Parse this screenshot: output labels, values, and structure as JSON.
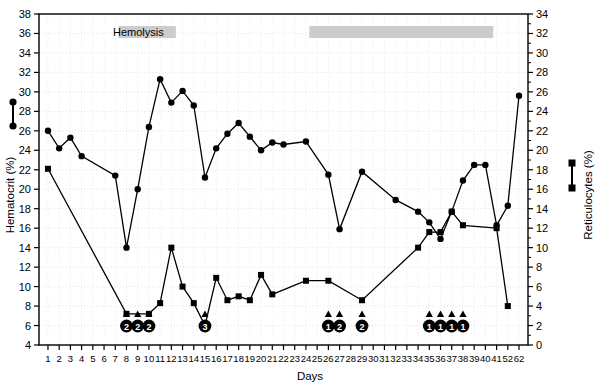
{
  "chart_data": {
    "type": "line",
    "title": "",
    "xlabel": "Days",
    "ylabel": "Hematocrit (%)",
    "y2label": "Reticulocytes (%)",
    "grid": true,
    "legend_position": "outside-left-and-right",
    "ylim": [
      4,
      38
    ],
    "ytick_step": 2,
    "yticks": [
      4,
      6,
      8,
      10,
      12,
      14,
      16,
      18,
      20,
      22,
      24,
      26,
      28,
      30,
      32,
      34,
      36,
      38
    ],
    "y2lim": [
      0,
      34
    ],
    "y2tick_step": 2,
    "y2ticks": [
      0,
      2,
      4,
      6,
      8,
      10,
      12,
      14,
      16,
      18,
      20,
      22,
      24,
      26,
      28,
      30,
      32,
      34
    ],
    "x": [
      1,
      2,
      3,
      4,
      5,
      6,
      7,
      8,
      9,
      10,
      11,
      12,
      13,
      14,
      15,
      16,
      17,
      18,
      19,
      20,
      21,
      22,
      23,
      24,
      25,
      26,
      27,
      28,
      29,
      30,
      31,
      32,
      33,
      34,
      35,
      36,
      37,
      38,
      39,
      40,
      41,
      52,
      62
    ],
    "xtick_labels": [
      "1",
      "2",
      "3",
      "4",
      "5",
      "6",
      "7",
      "8",
      "9",
      "10",
      "11",
      "12",
      "13",
      "14",
      "15",
      "16",
      "17",
      "18",
      "19",
      "20",
      "21",
      "22",
      "23",
      "24",
      "25",
      "26",
      "27",
      "28",
      "29",
      "30",
      "31",
      "32",
      "33",
      "34",
      "35",
      "36",
      "37",
      "38",
      "39",
      "40",
      "41",
      "52",
      "62"
    ],
    "series": [
      {
        "name": "Hematocrit (%)",
        "axis": "left",
        "marker": "circle",
        "color": "#000000",
        "points": [
          {
            "x": 1,
            "y": 26.0
          },
          {
            "x": 2,
            "y": 24.2
          },
          {
            "x": 3,
            "y": 25.3
          },
          {
            "x": 4,
            "y": 23.4
          },
          {
            "x": 7,
            "y": 21.4
          },
          {
            "x": 8,
            "y": 14.0
          },
          {
            "x": 9,
            "y": 20.0
          },
          {
            "x": 10,
            "y": 26.4
          },
          {
            "x": 11,
            "y": 31.3
          },
          {
            "x": 12,
            "y": 28.9
          },
          {
            "x": 13,
            "y": 30.1
          },
          {
            "x": 14,
            "y": 28.6
          },
          {
            "x": 15,
            "y": 21.2
          },
          {
            "x": 16,
            "y": 24.2
          },
          {
            "x": 17,
            "y": 25.7
          },
          {
            "x": 18,
            "y": 26.8
          },
          {
            "x": 19,
            "y": 25.4
          },
          {
            "x": 20,
            "y": 24.0
          },
          {
            "x": 21,
            "y": 24.8
          },
          {
            "x": 22,
            "y": 24.6
          },
          {
            "x": 24,
            "y": 24.9
          },
          {
            "x": 26,
            "y": 21.5
          },
          {
            "x": 27,
            "y": 15.9
          },
          {
            "x": 29,
            "y": 21.8
          },
          {
            "x": 32,
            "y": 18.9
          },
          {
            "x": 34,
            "y": 17.7
          },
          {
            "x": 35,
            "y": 16.6
          },
          {
            "x": 36,
            "y": 14.9
          },
          {
            "x": 37,
            "y": 17.7
          },
          {
            "x": 38,
            "y": 20.9
          },
          {
            "x": 39,
            "y": 22.5
          },
          {
            "x": 40,
            "y": 22.5
          },
          {
            "x": 41,
            "y": 16.3
          },
          {
            "x": 52,
            "y": 18.3
          },
          {
            "x": 62,
            "y": 29.6
          }
        ]
      },
      {
        "name": "Reticulocytes (%)",
        "axis": "right",
        "marker": "square",
        "color": "#000000",
        "points": [
          {
            "x": 1,
            "y": 18.1
          },
          {
            "x": 8,
            "y": 3.2
          },
          {
            "x": 10,
            "y": 3.2
          },
          {
            "x": 11,
            "y": 4.3
          },
          {
            "x": 12,
            "y": 10.0
          },
          {
            "x": 13,
            "y": 6.0
          },
          {
            "x": 14,
            "y": 4.3
          },
          {
            "x": 15,
            "y": 2.0
          },
          {
            "x": 16,
            "y": 6.9
          },
          {
            "x": 17,
            "y": 4.6
          },
          {
            "x": 18,
            "y": 5.0
          },
          {
            "x": 19,
            "y": 4.6
          },
          {
            "x": 20,
            "y": 7.2
          },
          {
            "x": 21,
            "y": 5.2
          },
          {
            "x": 24,
            "y": 6.6
          },
          {
            "x": 26,
            "y": 6.6
          },
          {
            "x": 29,
            "y": 4.6
          },
          {
            "x": 34,
            "y": 10.0
          },
          {
            "x": 35,
            "y": 11.6
          },
          {
            "x": 36,
            "y": 11.6
          },
          {
            "x": 37,
            "y": 13.7
          },
          {
            "x": 38,
            "y": 12.3
          },
          {
            "x": 41,
            "y": 12.0
          },
          {
            "x": 52,
            "y": 4.0
          }
        ]
      }
    ],
    "annotations": {
      "hemolysis_label": "Hemolysis",
      "hemolysis_bars": [
        {
          "x_start": 7.3,
          "x_end": 12.4,
          "color": "#cccccc"
        },
        {
          "x_start": 24.3,
          "x_end": 40.7,
          "color": "#cccccc"
        }
      ],
      "transfusion_markers": [
        {
          "x": 8,
          "units": "2"
        },
        {
          "x": 9,
          "units": "2"
        },
        {
          "x": 10,
          "units": "2"
        },
        {
          "x": 15,
          "units": "3"
        },
        {
          "x": 26,
          "units": "1"
        },
        {
          "x": 27,
          "units": "2"
        },
        {
          "x": 29,
          "units": "2"
        },
        {
          "x": 35,
          "units": "1"
        },
        {
          "x": 36,
          "units": "1"
        },
        {
          "x": 37,
          "units": "1"
        },
        {
          "x": 38,
          "units": "1"
        }
      ]
    }
  },
  "legend": {
    "left_marker": "circle",
    "right_marker": "square"
  }
}
